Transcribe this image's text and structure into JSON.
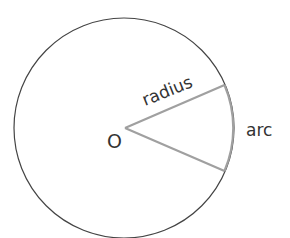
{
  "diagram": {
    "labels": {
      "radius": "radius",
      "arc": "arc",
      "center": "O"
    },
    "colors": {
      "circle": "#444444",
      "sector": "#a0a0a0",
      "text": "#333333"
    }
  }
}
